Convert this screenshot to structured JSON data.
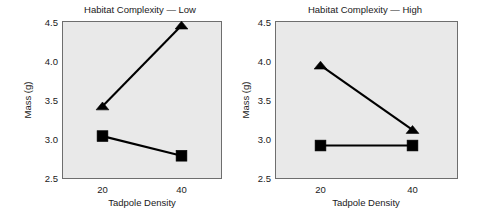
{
  "figure": {
    "background_color": "#ffffff",
    "plot_background_color": "#e9e9e9",
    "border_color": "#6e6e6e",
    "series_color": "#000000"
  },
  "chart_data": [
    {
      "type": "line",
      "title": "Habitat Complexity — Low",
      "xlabel": "Tadpole Density",
      "ylabel": "Mass (g)",
      "x": [
        20,
        40
      ],
      "xtick_labels": [
        "20",
        "40"
      ],
      "ytick_labels": [
        "2.5",
        "3.0",
        "3.5",
        "4.0",
        "4.5"
      ],
      "ytick_values": [
        2.5,
        3.0,
        3.5,
        4.0,
        4.5
      ],
      "ylim": [
        2.5,
        4.5
      ],
      "xlim": [
        10,
        50
      ],
      "grid": false,
      "legend": "none",
      "series": [
        {
          "name": "triangle-series",
          "marker": "triangle",
          "values": [
            3.42,
            4.45
          ]
        },
        {
          "name": "square-series",
          "marker": "square",
          "values": [
            3.04,
            2.79
          ]
        }
      ]
    },
    {
      "type": "line",
      "title": "Habitat Complexity — High",
      "xlabel": "Tadpole Density",
      "ylabel": "Mass (g)",
      "x": [
        20,
        40
      ],
      "xtick_labels": [
        "20",
        "40"
      ],
      "ytick_labels": [
        "2.5",
        "3.0",
        "3.5",
        "4.0",
        "4.5"
      ],
      "ytick_values": [
        2.5,
        3.0,
        3.5,
        4.0,
        4.5
      ],
      "ylim": [
        2.5,
        4.5
      ],
      "xlim": [
        10,
        50
      ],
      "grid": false,
      "legend": "none",
      "series": [
        {
          "name": "triangle-series",
          "marker": "triangle",
          "values": [
            3.94,
            3.12
          ]
        },
        {
          "name": "square-series",
          "marker": "square",
          "values": [
            2.92,
            2.92
          ]
        }
      ]
    }
  ]
}
